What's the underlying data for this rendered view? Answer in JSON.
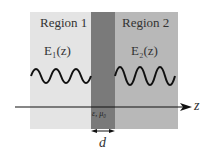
{
  "figure": {
    "region1": {
      "label": "Region 1",
      "field": "E₁(z)",
      "color": "#e4e4e4"
    },
    "region2": {
      "label": "Region 2",
      "field": "E₂(z)",
      "color": "#b8b8b8"
    },
    "slab": {
      "params": "ε, μ₀",
      "color": "#7a7a7a"
    },
    "axis": {
      "label": "z"
    },
    "thickness": {
      "label": "d"
    }
  }
}
